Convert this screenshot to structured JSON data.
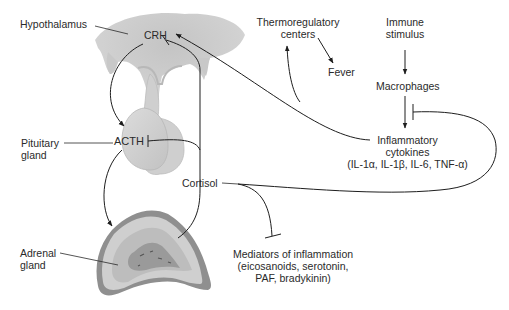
{
  "diagram": {
    "type": "HPA axis / cortisol anti-inflammatory feedback",
    "colors": {
      "tissue_light": "#d6d6d6",
      "tissue_mid": "#bdbdbd",
      "tissue_dark": "#8f8f8f",
      "line": "#1e1e1e",
      "text": "#2a2a2a"
    },
    "labels": {
      "hypothalamus": "Hypothalamus",
      "crh": "CRH",
      "pituitary_line1": "Pituitary",
      "pituitary_line2": "gland",
      "acth": "ACTH",
      "adrenal_line1": "Adrenal",
      "adrenal_line2": "gland",
      "cortisol": "Cortisol",
      "thermo_line1": "Thermoregulatory",
      "thermo_line2": "centers",
      "fever": "Fever",
      "immune_line1": "Immune",
      "immune_line2": "stimulus",
      "macrophages": "Macrophages",
      "cytokines_line1": "Inflammatory",
      "cytokines_line2": "cytokines",
      "cytokines_line3": "(IL-1α, IL-1β, IL-6, TNF-α)",
      "mediators_line1": "Mediators of inflammation",
      "mediators_line2": "(eicosanoids, serotonin,",
      "mediators_line3": "PAF, bradykinin)"
    },
    "edges": [
      {
        "from": "CRH",
        "to": "ACTH",
        "kind": "stimulates"
      },
      {
        "from": "ACTH",
        "to": "Adrenal gland",
        "kind": "stimulates"
      },
      {
        "from": "Adrenal gland",
        "to": "Cortisol",
        "kind": "produces"
      },
      {
        "from": "Cortisol",
        "to": "CRH",
        "kind": "inhibits"
      },
      {
        "from": "Cortisol",
        "to": "ACTH",
        "kind": "inhibits"
      },
      {
        "from": "Cortisol",
        "to": "Macrophages",
        "kind": "inhibits"
      },
      {
        "from": "Cortisol",
        "to": "Mediators of inflammation",
        "kind": "inhibits"
      },
      {
        "from": "Immune stimulus",
        "to": "Macrophages",
        "kind": "stimulates"
      },
      {
        "from": "Macrophages",
        "to": "Inflammatory cytokines",
        "kind": "stimulates"
      },
      {
        "from": "Inflammatory cytokines",
        "to": "CRH",
        "kind": "stimulates"
      },
      {
        "from": "Inflammatory cytokines",
        "to": "Thermoregulatory centers",
        "kind": "stimulates"
      },
      {
        "from": "Thermoregulatory centers",
        "to": "Fever",
        "kind": "stimulates"
      }
    ]
  }
}
